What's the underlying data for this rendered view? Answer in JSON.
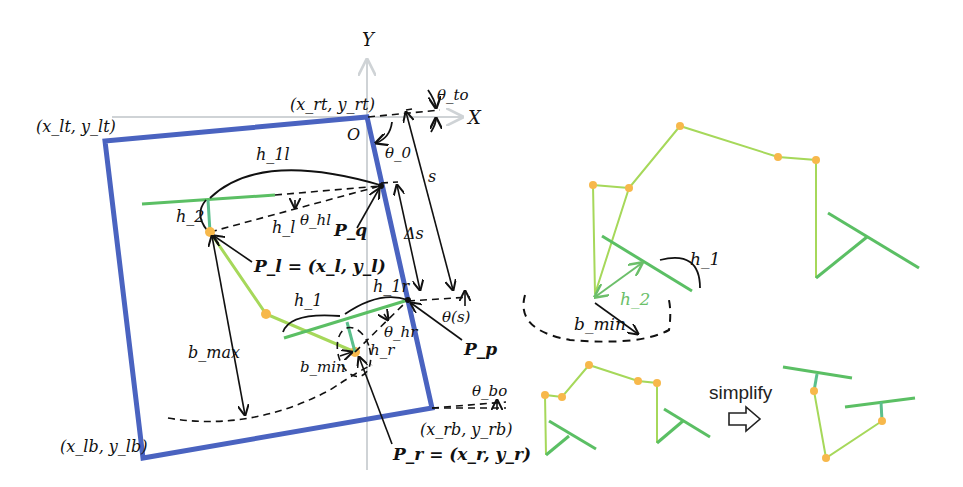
{
  "axes": {
    "x_label": "X",
    "y_label": "Y",
    "origin_label": "O"
  },
  "corners": {
    "left_top": "(x_lt, y_lt)",
    "right_top": "(x_rt, y_rt)",
    "left_bottom": "(x_lb, y_lb)",
    "right_bottom": "(x_rb, y_rb)"
  },
  "angles": {
    "theta_to": "θ_to",
    "theta_0": "θ_0",
    "theta_hl": "θ_hl",
    "theta_hr": "θ_hr",
    "theta_s": "θ(s)",
    "theta_bo": "θ_bo"
  },
  "distances": {
    "s": "s",
    "delta_s": "Δs",
    "h_1l": "h_1l",
    "h_1r": "h_1r",
    "h_1": "h_1",
    "h_2": "h_2",
    "h_l": "h_l",
    "h_r": "h_r",
    "b_max": "b_max",
    "b_min": "b_min"
  },
  "points": {
    "P_q": "P_q",
    "P_p": "P_p",
    "P_l": "P_l = (x_l, y_l)",
    "P_r": "P_r = (x_r, y_r)"
  },
  "right_panel": {
    "h_1": "h_1",
    "h_2": "h_2",
    "b_min": "b_min",
    "simplify_label": "simplify"
  },
  "colors": {
    "frame": "#4a63c0",
    "lane": "#5bbf64",
    "path": "#a6d85a",
    "node": "#f7b84b",
    "axis": "#cfd3d6"
  }
}
